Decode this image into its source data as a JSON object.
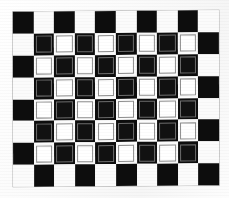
{
  "image": {
    "title": "Checkerboard calibration target",
    "kind": "checkerboard-pattern",
    "description": "Scanned black and white checkerboard calibration grid on white paper",
    "background_color": "#ffffff",
    "width_px": 229,
    "height_px": 198
  },
  "board": {
    "name": "checkerboard",
    "columns": 10,
    "rows": 8,
    "origin_color": "dark",
    "left_px": 13,
    "top_px": 11,
    "width_px": 206,
    "height_px": 175,
    "cell_width_px": 20.6,
    "cell_height_px": 21.9,
    "rotation_deg": -0.45,
    "dark_color": "#0d0d0d",
    "light_color": "#fbfbfb",
    "inset_border_color": "#8d8d8d",
    "outer_border_color": "#9a9a9a",
    "inset_rows": [
      1,
      2,
      3,
      4,
      5,
      6
    ],
    "inset_columns": [
      1,
      2,
      3,
      4,
      5,
      6,
      7,
      8
    ],
    "grid": [
      [
        "dark",
        "light",
        "dark",
        "light",
        "dark",
        "light",
        "dark",
        "light",
        "dark",
        "light"
      ],
      [
        "light",
        "dark",
        "light",
        "dark",
        "light",
        "dark",
        "light",
        "dark",
        "light",
        "dark"
      ],
      [
        "dark",
        "light",
        "dark",
        "light",
        "dark",
        "light",
        "dark",
        "light",
        "dark",
        "light"
      ],
      [
        "light",
        "dark",
        "light",
        "dark",
        "light",
        "dark",
        "light",
        "dark",
        "light",
        "dark"
      ],
      [
        "dark",
        "light",
        "dark",
        "light",
        "dark",
        "light",
        "dark",
        "light",
        "dark",
        "light"
      ],
      [
        "light",
        "dark",
        "light",
        "dark",
        "light",
        "dark",
        "light",
        "dark",
        "light",
        "dark"
      ],
      [
        "dark",
        "light",
        "dark",
        "light",
        "dark",
        "light",
        "dark",
        "light",
        "dark",
        "light"
      ],
      [
        "light",
        "dark",
        "light",
        "dark",
        "light",
        "dark",
        "light",
        "dark",
        "light",
        "dark"
      ]
    ]
  }
}
